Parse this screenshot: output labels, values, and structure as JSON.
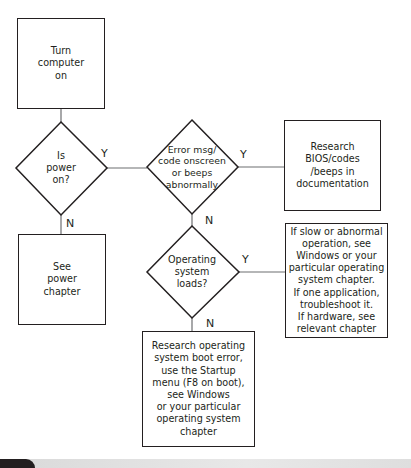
{
  "flowchart": {
    "nodes": {
      "start": {
        "type": "process",
        "text": "Turn computer on",
        "lines": [
          "Turn",
          "computer",
          "on"
        ]
      },
      "power_check": {
        "type": "decision",
        "text": "Is power on?",
        "lines": [
          "Is",
          "power",
          "on?"
        ]
      },
      "power_chapter": {
        "type": "process",
        "text": "See power chapter",
        "lines": [
          "See",
          "power",
          "chapter"
        ]
      },
      "error_check": {
        "type": "decision",
        "text": "Error msg/ code onscreen or beeps abnormally",
        "lines": [
          "Error msg/",
          "code onscreen",
          "or beeps",
          "abnormally"
        ]
      },
      "research_bios": {
        "type": "process",
        "text": "Research BIOS/codes /beeps in documentation",
        "lines": [
          "Research",
          "BIOS/codes",
          "/beeps in",
          "documentation"
        ]
      },
      "os_check": {
        "type": "decision",
        "text": "Operating system loads?",
        "lines": [
          "Operating",
          "system",
          "loads?"
        ]
      },
      "os_loads_advice": {
        "type": "process",
        "text": "If slow or abnormal operation, see Windows or your particular operating system chapter. If one application, troubleshoot it. If hardware, see relevant chapter",
        "lines": [
          "If slow or abnormal",
          "operation,  see",
          "Windows or your",
          "particular operating",
          "system chapter.",
          "If one application,",
          "troubleshoot it.",
          "If hardware, see",
          "relevant chapter"
        ]
      },
      "os_boot_error": {
        "type": "process",
        "text": "Research operating system boot error, use the Startup menu (F8 on boot), see Windows or your particular operating system chapter",
        "lines": [
          "Research operating",
          "system boot error,",
          "use the Startup",
          "menu (F8 on boot),",
          "see Windows",
          "or your particular",
          "operating system",
          "chapter"
        ]
      }
    },
    "edges": [
      {
        "from": "start",
        "to": "power_check",
        "label": ""
      },
      {
        "from": "power_check",
        "to": "error_check",
        "label": "Y"
      },
      {
        "from": "power_check",
        "to": "power_chapter",
        "label": "N"
      },
      {
        "from": "error_check",
        "to": "research_bios",
        "label": "Y"
      },
      {
        "from": "error_check",
        "to": "os_check",
        "label": "N"
      },
      {
        "from": "os_check",
        "to": "os_loads_advice",
        "label": "Y"
      },
      {
        "from": "os_check",
        "to": "os_boot_error",
        "label": "N"
      }
    ],
    "labels": {
      "yes": "Y",
      "no": "N"
    }
  }
}
